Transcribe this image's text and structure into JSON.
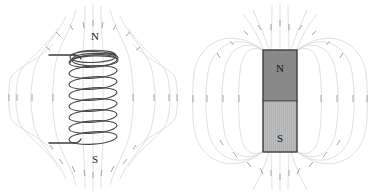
{
  "figure": {
    "background_color": "#ffffff",
    "width": 369,
    "height": 195
  },
  "panels": [
    {
      "id": "solenoid",
      "name": "solenoid-field-diagram",
      "labels": {
        "north": "N",
        "south": "S"
      },
      "coil": {
        "turns": 8,
        "wire_color": "#4a4a4a",
        "lead_top_label": "",
        "lead_bottom_label": ""
      },
      "field": {
        "line_color": "#d2d2d2",
        "arrow_color": "#9a9a9a",
        "direction": "out-of-north-into-south",
        "loop_count_per_side": 4
      }
    },
    {
      "id": "bar-magnet",
      "name": "bar-magnet-field-diagram",
      "labels": {
        "north": "N",
        "south": "S"
      },
      "magnet": {
        "north_color": "#8a8a8a",
        "south_color": "#bdbdbd",
        "outline_color": "#3c3c3c",
        "x": 78,
        "y": 50,
        "width": 34,
        "height": 102,
        "split_y": 101
      },
      "field": {
        "line_color": "#d2d2d2",
        "arrow_color": "#9a9a9a",
        "direction": "out-of-north-into-south",
        "loop_count_per_side": 4
      }
    }
  ],
  "colors": {
    "field_line": "#d2d2d2",
    "field_arrow": "#9a9a9a",
    "coil_wire": "#4a4a4a",
    "magnet_north": "#8a8a8a",
    "magnet_south": "#bdbdbd",
    "label_text": "#1a1a1a",
    "background": "#ffffff"
  }
}
